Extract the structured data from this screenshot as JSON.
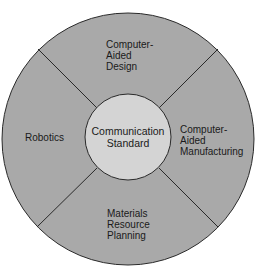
{
  "diagram": {
    "type": "wheel",
    "center": {
      "lines": [
        "Communication",
        "Standard"
      ]
    },
    "segments": [
      {
        "position": "top",
        "lines": [
          "Computer-",
          "Aided",
          "Design"
        ]
      },
      {
        "position": "right",
        "lines": [
          "Computer-",
          "Aided",
          "Manufacturing"
        ]
      },
      {
        "position": "bottom",
        "lines": [
          "Materials",
          "Resource",
          "Planning"
        ]
      },
      {
        "position": "left",
        "lines": [
          "Robotics"
        ]
      }
    ],
    "colors": {
      "outer_fill": "#a9a9a9",
      "inner_fill": "#d4d4d4",
      "stroke": "#2a2a2a"
    }
  }
}
